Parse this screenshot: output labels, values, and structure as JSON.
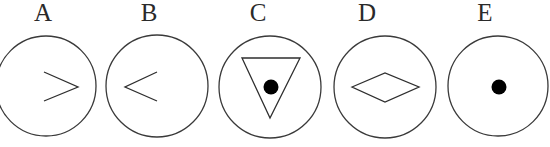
{
  "figure": {
    "options": [
      {
        "label": "A",
        "label_x": 43,
        "circle": {
          "cx": 46,
          "cy": 86,
          "r": 50
        },
        "symbol": "greater-than-chevron",
        "points": "44,72 78,87 44,101"
      },
      {
        "label": "B",
        "label_x": 149,
        "circle": {
          "cx": 157,
          "cy": 86,
          "r": 51
        },
        "symbol": "less-than-chevron",
        "points": "157,72 125,87 157,101"
      },
      {
        "label": "C",
        "label_x": 258,
        "circle": {
          "cx": 270,
          "cy": 87,
          "r": 51
        },
        "symbol": "inverted-triangle-with-dot",
        "points": "242,58 300,58 270,118",
        "dot": {
          "cx": 271,
          "cy": 87,
          "r": 7.5
        }
      },
      {
        "label": "D",
        "label_x": 367,
        "circle": {
          "cx": 385,
          "cy": 87,
          "r": 51
        },
        "symbol": "diamond",
        "points": "352,87 385,73 419,87 385,102"
      },
      {
        "label": "E",
        "label_x": 485,
        "circle": {
          "cx": 498,
          "cy": 86,
          "r": 50
        },
        "symbol": "dot",
        "dot": {
          "cx": 499,
          "cy": 87,
          "r": 7.5
        }
      }
    ]
  }
}
